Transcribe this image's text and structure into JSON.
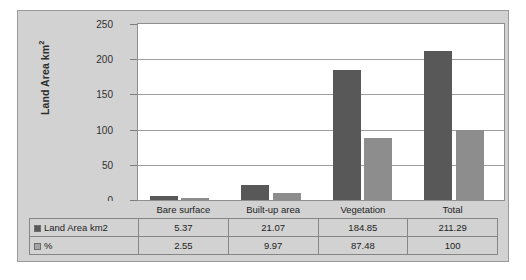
{
  "chart_data": {
    "type": "bar",
    "title": "",
    "xlabel": "",
    "ylabel": "Land Area km²",
    "ylim": [
      0,
      250
    ],
    "yticks": [
      0,
      50,
      100,
      150,
      200,
      250
    ],
    "grid": true,
    "legend_position": "table-row-labels",
    "categories": [
      "Bare surface",
      "Built-up area",
      "Vegetation",
      "Total"
    ],
    "series": [
      {
        "name": "Land Area km2",
        "color": "#585858",
        "values": [
          5.37,
          21.07,
          184.85,
          211.29
        ],
        "labels": [
          "5.37",
          "21.07",
          "184.85",
          "211.29"
        ]
      },
      {
        "name": "%",
        "color": "#8d8d8d",
        "values": [
          2.55,
          9.97,
          87.48,
          100
        ],
        "labels": [
          "2.55",
          "9.97",
          "87.48",
          "100"
        ]
      }
    ]
  },
  "axis": {
    "y_title_main": "Land Area km",
    "y_title_sup": "2",
    "tick_labels": [
      "250",
      "200",
      "150",
      "100",
      "50",
      "0"
    ]
  },
  "table": {
    "row_header_series_a": "Land Area km2",
    "row_header_series_b": "%"
  }
}
